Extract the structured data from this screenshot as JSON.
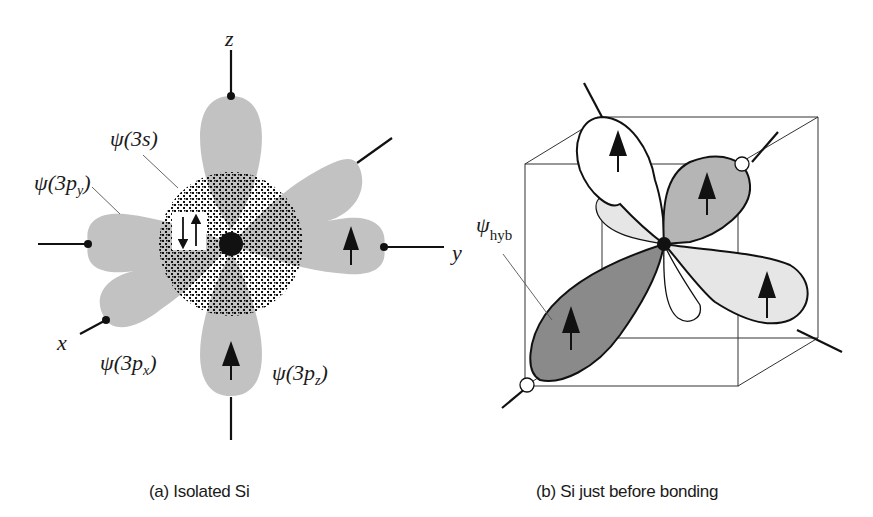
{
  "figure": {
    "panel_a": {
      "caption": "(a) Isolated Si",
      "axes": {
        "z": "z",
        "y": "y",
        "x": "x"
      },
      "orbitals": {
        "s": {
          "label_prefix": "ψ(3",
          "label_var": "s",
          "label_suffix": ")",
          "electrons": "↓↑ paired"
        },
        "py": {
          "label_prefix": "ψ(3",
          "label_var": "p",
          "label_sub": "y",
          "label_suffix": ")",
          "electrons": "↑"
        },
        "px": {
          "label_prefix": "ψ(3",
          "label_var": "p",
          "label_sub": "x",
          "label_suffix": ")"
        },
        "pz": {
          "label_prefix": "ψ(3",
          "label_var": "p",
          "label_sub": "z",
          "label_suffix": ")",
          "electrons": "↑"
        }
      }
    },
    "panel_b": {
      "caption": "(b) Si just before bonding",
      "hybrid_label": {
        "symbol": "ψ",
        "subscript": "hyb"
      },
      "lobes": [
        {
          "name": "upper-left",
          "fill": "#ffffff",
          "electron": "↑"
        },
        {
          "name": "upper-right",
          "fill": "#b5b5b5",
          "electron": "↑"
        },
        {
          "name": "lower-left",
          "fill": "#8a8a8a",
          "electron": "↑"
        },
        {
          "name": "lower-right",
          "fill": "#e6e6e6",
          "electron": "↑"
        }
      ]
    },
    "colors": {
      "lobe_gray": "#c2c2c2",
      "ink": "#111111",
      "dark_lobe": "#8a8a8a",
      "mid_lobe": "#b5b5b5",
      "light_lobe": "#e6e6e6"
    }
  }
}
